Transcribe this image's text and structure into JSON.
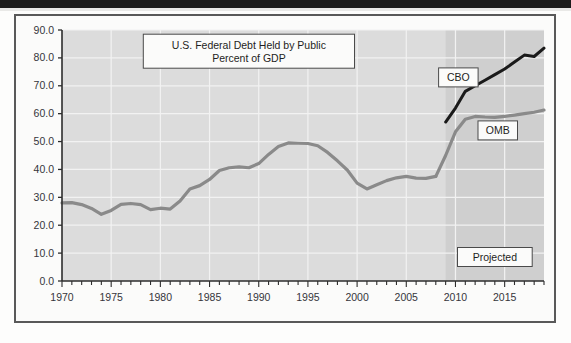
{
  "figure": {
    "title_line1": "U.S. Federal Debt Held by Public",
    "title_line2": "Percent of GDP",
    "projected_label": "Projected",
    "cbo_label": "CBO",
    "omb_label": "OMB"
  },
  "colors": {
    "plot_background": "#dcdcdc",
    "projected_background": "#cfcfcf",
    "gridline": "#f2f2f2",
    "axis": "#2d2d2d",
    "historical_line": "#8a8a8a",
    "omb_line": "#8a8a8a",
    "cbo_line": "#1a1a1a",
    "frame": "#595959",
    "top_band": "#1c1c1c",
    "text": "#35353a"
  },
  "chart_data": {
    "type": "line",
    "xlabel": "",
    "ylabel": "Percent of GDP",
    "xlim": [
      1970,
      2019
    ],
    "ylim": [
      0.0,
      90.0
    ],
    "yticks": [
      0.0,
      10.0,
      20.0,
      30.0,
      40.0,
      50.0,
      60.0,
      70.0,
      80.0,
      90.0
    ],
    "ytick_labels": [
      "0.0",
      "10.0",
      "20.0",
      "30.0",
      "40.0",
      "50.0",
      "60.0",
      "70.0",
      "80.0",
      "90.0"
    ],
    "xticks_major": [
      1970,
      1975,
      1980,
      1985,
      1990,
      1995,
      2000,
      2005,
      2010,
      2015
    ],
    "xtick_labels": [
      "1970",
      "1975",
      "1980",
      "1985",
      "1990",
      "1995",
      "2000",
      "2005",
      "2010",
      "2015"
    ],
    "xtick_minor_step": 1,
    "grid": true,
    "legend": "annotations",
    "projection_start_year": 2009,
    "annotations": [
      {
        "text": "U.S. Federal Debt Held by Public",
        "x": 1989,
        "y": 84.5,
        "type": "title-box"
      },
      {
        "text": "Percent of GDP",
        "x": 1989,
        "y": 80.5,
        "type": "title-box"
      },
      {
        "text": "CBO",
        "x": 2010.2,
        "y": 73.0,
        "type": "series-label"
      },
      {
        "text": "OMB",
        "x": 2014.2,
        "y": 54.0,
        "type": "series-label"
      },
      {
        "text": "Projected",
        "x": 2014.0,
        "y": 8.5,
        "type": "region-label"
      }
    ],
    "series": [
      {
        "name": "Historical (Debt Held by Public)",
        "color": "#8a8a8a",
        "style": "solid",
        "x": [
          1970,
          1971,
          1972,
          1973,
          1974,
          1975,
          1976,
          1977,
          1978,
          1979,
          1980,
          1981,
          1982,
          1983,
          1984,
          1985,
          1986,
          1987,
          1988,
          1989,
          1990,
          1991,
          1992,
          1993,
          1994,
          1995,
          1996,
          1997,
          1998,
          1999,
          2000,
          2001,
          2002,
          2003,
          2004,
          2005,
          2006,
          2007,
          2008
        ],
        "values": [
          28.0,
          28.1,
          27.4,
          26.0,
          23.9,
          25.3,
          27.5,
          27.8,
          27.4,
          25.6,
          26.1,
          25.8,
          28.7,
          33.0,
          34.2,
          36.4,
          39.6,
          40.6,
          40.9,
          40.6,
          42.1,
          45.4,
          48.2,
          49.5,
          49.4,
          49.3,
          48.5,
          46.1,
          43.1,
          39.8,
          35.1,
          33.0,
          34.5,
          36.0,
          37.0,
          37.5,
          36.9,
          36.8,
          37.5
        ]
      },
      {
        "name": "CBO",
        "color": "#1a1a1a",
        "style": "solid",
        "x": [
          2009,
          2010,
          2011,
          2012,
          2013,
          2014,
          2015,
          2016,
          2017,
          2018,
          2019
        ],
        "values": [
          57.0,
          62.0,
          68.0,
          70.0,
          72.0,
          74.0,
          76.0,
          78.5,
          81.0,
          80.5,
          83.5
        ]
      },
      {
        "name": "OMB",
        "color": "#8a8a8a",
        "style": "solid",
        "x": [
          2008,
          2009,
          2010,
          2011,
          2012,
          2013,
          2014,
          2015,
          2016,
          2017,
          2018,
          2019
        ],
        "values": [
          37.5,
          45.0,
          53.5,
          58.0,
          59.0,
          58.8,
          58.7,
          59.0,
          59.5,
          60.0,
          60.5,
          61.3
        ]
      }
    ]
  }
}
